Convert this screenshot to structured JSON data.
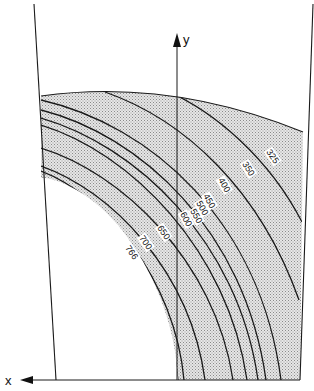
{
  "diagram": {
    "type": "contour-isotherm-map",
    "axes": {
      "x_label": "x",
      "y_label": "y",
      "x_direction": "left",
      "y_direction": "up"
    },
    "shading": {
      "fill": "#d4d4d4",
      "pattern": "stipple"
    },
    "isolines": [
      {
        "value": "325",
        "label": "325"
      },
      {
        "value": "350",
        "label": "350"
      },
      {
        "value": "400",
        "label": "400"
      },
      {
        "value": "450",
        "label": "450"
      },
      {
        "value": "500",
        "label": "500"
      },
      {
        "value": "550",
        "label": "550"
      },
      {
        "value": "600",
        "label": "600"
      },
      {
        "value": "650",
        "label": "650"
      },
      {
        "value": "700",
        "label": "700"
      },
      {
        "value": "766",
        "label": "766"
      }
    ]
  }
}
